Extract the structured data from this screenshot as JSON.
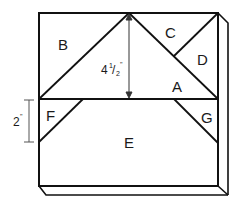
{
  "diagram": {
    "type": "quilt block cutting layout",
    "colors": {
      "stroke": "#111111",
      "dimension_line": "#555555",
      "background": "#ffffff"
    },
    "pieces": [
      {
        "id": "A",
        "label": "A",
        "description": "large center triangle"
      },
      {
        "id": "B",
        "label": "B",
        "description": "top-left triangle"
      },
      {
        "id": "C",
        "label": "C",
        "description": "top-right upper triangle"
      },
      {
        "id": "D",
        "label": "D",
        "description": "top-right lower triangle"
      },
      {
        "id": "E",
        "label": "E",
        "description": "bottom trapezoid"
      },
      {
        "id": "F",
        "label": "F",
        "description": "left small triangle"
      },
      {
        "id": "G",
        "label": "G",
        "description": "right small triangle"
      }
    ],
    "dimensions": {
      "height_top": {
        "whole": "4",
        "fraction_num": "1",
        "fraction_den": "2",
        "unit": "\""
      },
      "height_side": {
        "value": "2",
        "unit": "\""
      }
    }
  }
}
